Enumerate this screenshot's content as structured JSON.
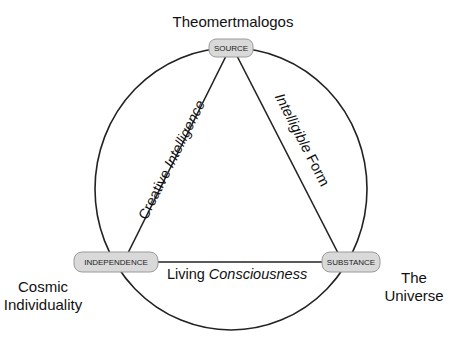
{
  "diagram": {
    "nodes": {
      "source": {
        "label": "SOURCE",
        "caption": "Theomertmalogos"
      },
      "independence": {
        "label": "INDEPENDENCE",
        "caption_line1": "Cosmic",
        "caption_line2": "Individuality"
      },
      "substance": {
        "label": "SUBSTANCE",
        "caption_line1": "The",
        "caption_line2": "Universe"
      }
    },
    "edges": {
      "source_independence": {
        "plain": "Creative ",
        "italic": "Intelligence"
      },
      "source_substance": {
        "italic": "Intelligible",
        "plain": " Form"
      },
      "independence_substance": {
        "plain": "Living ",
        "italic": "Consciousness"
      }
    },
    "colors": {
      "node_fill": "#d9d9d9",
      "node_stroke": "#9a9a9a",
      "line": "#222222"
    }
  }
}
